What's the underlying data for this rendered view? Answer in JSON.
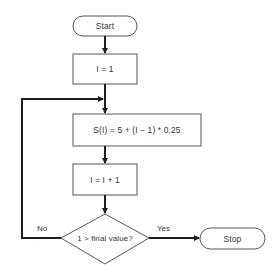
{
  "diagram": {
    "type": "flowchart",
    "nodes": [
      {
        "id": "start",
        "shape": "terminator",
        "text": "Start"
      },
      {
        "id": "init",
        "shape": "process",
        "text": "I = 1"
      },
      {
        "id": "compute",
        "shape": "process",
        "text": "S(I) = 5 + (I − 1) * 0.25"
      },
      {
        "id": "increment",
        "shape": "process",
        "text": "I = I + 1"
      },
      {
        "id": "decision",
        "shape": "decision",
        "text": "1 > final value?"
      },
      {
        "id": "stop",
        "shape": "terminator",
        "text": "Stop"
      }
    ],
    "edges": [
      {
        "from": "start",
        "to": "init",
        "label": ""
      },
      {
        "from": "init",
        "to": "compute",
        "label": ""
      },
      {
        "from": "compute",
        "to": "increment",
        "label": ""
      },
      {
        "from": "increment",
        "to": "decision",
        "label": ""
      },
      {
        "from": "decision",
        "to": "stop",
        "label": "Yes"
      },
      {
        "from": "decision",
        "to": "compute",
        "label": "No"
      }
    ],
    "labels": {
      "no": "No",
      "yes": "Yes"
    },
    "colors": {
      "line": "#1e1e1e",
      "border": "#555555",
      "text": "#333333",
      "background": "#ffffff"
    }
  }
}
